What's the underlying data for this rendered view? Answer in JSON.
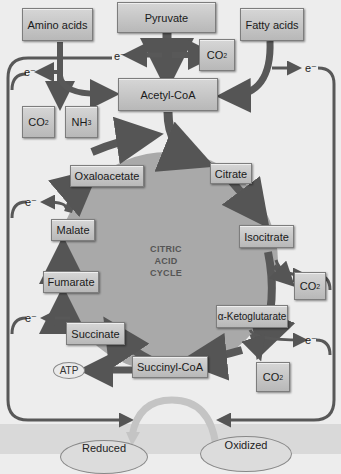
{
  "diagram": {
    "title": "Citric Acid Cycle",
    "center_label": [
      "CITRIC",
      "ACID",
      "CYCLE"
    ],
    "inputs": {
      "amino_acids": "Amino acids",
      "pyruvate": "Pyruvate",
      "fatty_acids": "Fatty acids"
    },
    "byproducts": {
      "co2": "CO",
      "co2_sub": "2",
      "nh3": "NH",
      "nh3_sub": "3",
      "atp": "ATP",
      "electron": "e⁻"
    },
    "acetyl_coa": "Acetyl-CoA",
    "cycle_intermediates": [
      "Citrate",
      "Isocitrate",
      "α-Ketoglutarate",
      "Succinyl-CoA",
      "Succinate",
      "Fumarate",
      "Malate",
      "Oxaloacetate"
    ],
    "carriers": {
      "reduced": "Reduced",
      "oxidized": "Oxidized"
    },
    "colors": {
      "arrow": "#555555",
      "cycle_fill": "#a9a9a9",
      "box_fill": "#c8c8c8",
      "background": "#ededed"
    }
  }
}
